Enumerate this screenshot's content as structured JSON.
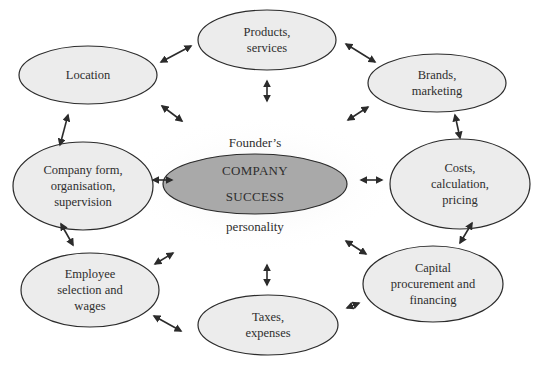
{
  "diagram": {
    "center": {
      "line1": "COMPANY",
      "line2": "SUCCESS",
      "label_above": "Founder’s",
      "label_below": "personality",
      "fill": "#a9a9a9"
    },
    "node_fill": "#ececec",
    "stroke": "#2b2b2b",
    "nodes": [
      {
        "id": "products",
        "label": "Products,\nservices"
      },
      {
        "id": "location",
        "label": "Location"
      },
      {
        "id": "brands",
        "label": "Brands,\nmarketing"
      },
      {
        "id": "company-form",
        "label": "Company form,\norganisation,\nsupervision"
      },
      {
        "id": "costs",
        "label": "Costs,\ncalculation,\npricing"
      },
      {
        "id": "employee",
        "label": "Employee\nselection and\nwages"
      },
      {
        "id": "capital",
        "label": "Capital\nprocurement and\nfinancing"
      },
      {
        "id": "taxes",
        "label": "Taxes,\nexpenses"
      }
    ],
    "connections": [
      [
        "location",
        "products"
      ],
      [
        "products",
        "brands"
      ],
      [
        "location",
        "company-form"
      ],
      [
        "brands",
        "costs"
      ],
      [
        "company-form",
        "center"
      ],
      [
        "center",
        "costs"
      ],
      [
        "company-form",
        "employee"
      ],
      [
        "costs",
        "capital"
      ],
      [
        "employee",
        "taxes"
      ],
      [
        "taxes",
        "capital"
      ],
      [
        "products",
        "center"
      ],
      [
        "location",
        "center"
      ],
      [
        "brands",
        "center"
      ],
      [
        "employee",
        "center"
      ],
      [
        "capital",
        "center"
      ],
      [
        "taxes",
        "center"
      ]
    ]
  }
}
